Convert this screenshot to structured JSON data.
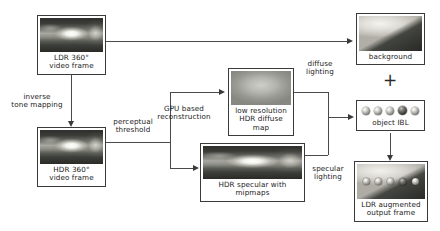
{
  "diagram": {
    "nodes": {
      "ldr_source": {
        "caption": "LDR 360°\nvideo frame",
        "thumb": "ldr-360-video-thumbnail"
      },
      "hdr_source": {
        "caption": "HDR 360°\nvideo frame",
        "thumb": "hdr-360-video-thumbnail"
      },
      "diffuse_map": {
        "caption": "low resolution\nHDR diffuse map",
        "thumb": "low-res-hdr-diffuse-map-thumbnail"
      },
      "specular_map": {
        "caption": "HDR specular with mipmaps",
        "thumb": "hdr-specular-mipmaps-thumbnail"
      },
      "background": {
        "caption": "background",
        "thumb": "background-photo-thumbnail"
      },
      "object_ibl": {
        "caption": "object IBL",
        "thumb": "object-ibl-spheres"
      },
      "output": {
        "caption": "LDR augmented\noutput frame",
        "thumb": "ldr-augmented-output-thumbnail"
      }
    },
    "edge_labels": {
      "inverse_tone_mapping": "inverse\ntone mapping",
      "perceptual_threshold": "perceptual\nthreshold",
      "gpu_reconstruction": "GPU based\nreconstruction",
      "diffuse_lighting": "diffuse\nlighting",
      "specular_lighting": "specular\nlighting"
    },
    "operators": {
      "plus": "+"
    },
    "colors": {
      "line": "#4a4a4a",
      "box_border": "#3a3a3a",
      "text": "#1a1a1a",
      "background": "#ffffff"
    }
  }
}
